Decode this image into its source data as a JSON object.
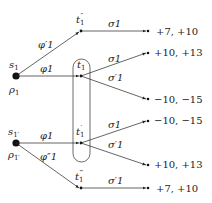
{
  "diagram": {
    "type": "game-tree",
    "roots": [
      {
        "id": "s1",
        "label": "s",
        "sub": "1",
        "belief": "ρ",
        "belief_sub": "1"
      },
      {
        "id": "s1p",
        "label": "s",
        "sub": "1′",
        "belief": "ρ",
        "belief_sub": "1′"
      }
    ],
    "nodes": {
      "t1pp": {
        "label": "t",
        "sub": "1",
        "sup": "″"
      },
      "t1": {
        "label": "t",
        "sub": "1",
        "sup": ""
      },
      "t1p": {
        "label": "t",
        "sub": "1",
        "sup": "′"
      },
      "t1ppp": {
        "label": "t",
        "sub": "1",
        "sup": "‴"
      }
    },
    "edges": {
      "s1_t1pp": "φ′1",
      "s1_t1": "φ1",
      "s1p_t1p": "φ1",
      "s1p_t1ppp": "φ″1",
      "t1pp_a": "σ1",
      "t1_a": "σ1",
      "t1_b": "σ′1",
      "t1p_a": "σ1",
      "t1p_b": "σ′1",
      "t1ppp_a": "σ′1"
    },
    "payoffs": [
      "+7, +10",
      "+10, +13",
      "−10, −15",
      "−10, −15",
      "+10, +13",
      "+7, +10"
    ],
    "information_set": [
      "t1",
      "t1p"
    ]
  }
}
